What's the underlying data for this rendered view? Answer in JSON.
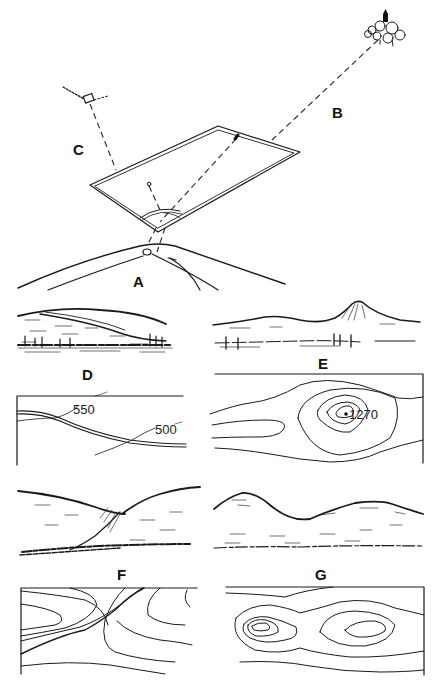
{
  "figure": {
    "labels": {
      "A": "A",
      "B": "B",
      "C": "C",
      "D": "D",
      "E": "E",
      "F": "F",
      "G": "G"
    },
    "panel_d_map": {
      "contour_labels": [
        "550",
        "500"
      ]
    },
    "panel_e_map": {
      "spot_height": "1270"
    },
    "colors": {
      "ink": "#1a1a1a",
      "paper": "#ffffff"
    }
  }
}
